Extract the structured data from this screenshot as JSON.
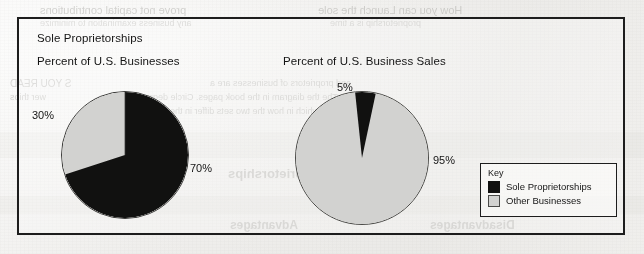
{
  "figure": {
    "title": "Sole Proprietorships",
    "left_subtitle": "Percent of U.S. Businesses",
    "right_subtitle": "Percent of U.S. Business Sales"
  },
  "legend": {
    "title": "Key",
    "items": [
      {
        "label": "Sole Proprietorships",
        "swatch": "dark",
        "color": "#111110"
      },
      {
        "label": "Other Businesses",
        "swatch": "light",
        "color": "#d2d2d0"
      }
    ]
  },
  "labels": {
    "left_dark": "70%",
    "left_light": "30%",
    "right_dark": "5%",
    "right_light": "95%"
  },
  "colors": {
    "sole_proprietorships": "#111110",
    "other_businesses": "#d2d2d0",
    "frame": "#1d1d1d",
    "paper": "#f2f1ef",
    "text": "#141414"
  },
  "bleed_through": [
    {
      "text": "prove not capital contributions",
      "x": 40,
      "y": 4,
      "size": 11,
      "serif": false
    },
    {
      "text": "How you can Launch the sole",
      "x": 318,
      "y": 4,
      "size": 11,
      "serif": false
    },
    {
      "text": "any business examination to minimize",
      "x": 40,
      "y": 18,
      "size": 9,
      "serif": false
    },
    {
      "text": "proprietorship is a time",
      "x": 330,
      "y": 18,
      "size": 9,
      "serif": false
    },
    {
      "text": "S YOU READ",
      "x": 10,
      "y": 78,
      "size": 10,
      "serif": false
    },
    {
      "text": "and proprietors of businesses are a",
      "x": 210,
      "y": 78,
      "size": 9,
      "serif": false
    },
    {
      "text": "wer thios",
      "x": 10,
      "y": 92,
      "size": 9,
      "serif": false
    },
    {
      "text": "pose. The the diagram in the book pages. Circle degree",
      "x": 140,
      "y": 92,
      "size": 9,
      "serif": false
    },
    {
      "text": "gan which in how the two sets differ in the",
      "x": 170,
      "y": 106,
      "size": 9,
      "serif": false
    },
    {
      "text": "Sole Proprietorships",
      "x": 228,
      "y": 166,
      "size": 13,
      "serif": false
    },
    {
      "text": "Advantages",
      "x": 230,
      "y": 218,
      "size": 12,
      "serif": false
    },
    {
      "text": "Disadvantages",
      "x": 430,
      "y": 218,
      "size": 12,
      "serif": false
    }
  ],
  "chart_data": [
    {
      "type": "pie",
      "title": "Percent of U.S. Businesses",
      "labels": [
        "Sole Proprietorships",
        "Other Businesses"
      ],
      "values": [
        70,
        30
      ],
      "data_labels": [
        "70%",
        "30%"
      ],
      "colors": [
        "#111110",
        "#d2d2d0"
      ],
      "start_angle_deg": 0,
      "direction": "clockwise",
      "legend": "shared-key-bottom-right",
      "units": "percent"
    },
    {
      "type": "pie",
      "title": "Percent of U.S. Business Sales",
      "labels": [
        "Sole Proprietorships",
        "Other Businesses"
      ],
      "values": [
        5,
        95
      ],
      "data_labels": [
        "5%",
        "95%"
      ],
      "colors": [
        "#111110",
        "#d2d2d0"
      ],
      "start_angle_deg": -6,
      "direction": "clockwise",
      "legend": "shared-key-bottom-right",
      "units": "percent"
    }
  ]
}
